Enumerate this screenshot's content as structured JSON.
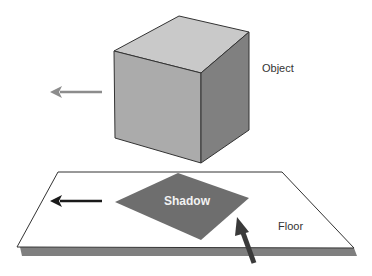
{
  "diagram": {
    "labels": {
      "object": "Object",
      "shadow": "Shadow",
      "floor": "Floor"
    },
    "colors": {
      "cube_top": "#c9c9c9",
      "cube_front": "#aaaaaa",
      "cube_side": "#7f7f7f",
      "floor": "#ffffff",
      "floor_edge": "#7a7a7a",
      "shadow": "#6e6e6e",
      "object_arrow": "#8c8c8c",
      "shadow_arrow": "#1a1a1a",
      "light_arrow": "#3a3a3a"
    },
    "arrows": [
      {
        "name": "object-motion-arrow",
        "direction": "left"
      },
      {
        "name": "shadow-motion-arrow",
        "direction": "left"
      },
      {
        "name": "light-direction-arrow",
        "direction": "up-left"
      }
    ]
  }
}
